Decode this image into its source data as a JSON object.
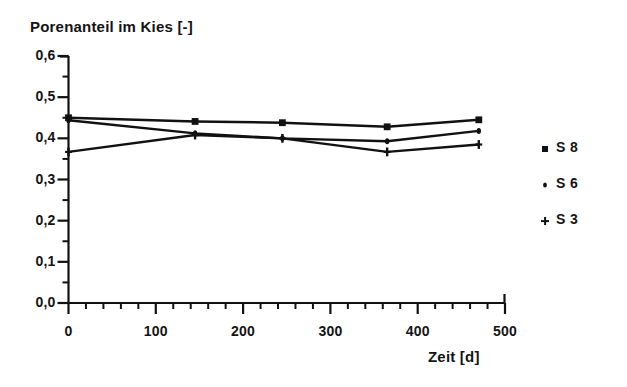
{
  "chart_data": {
    "type": "line",
    "title": "Porenanteil im Kies [-]",
    "xlabel": "Zeit [d]",
    "ylabel": "Porenanteil im Kies [-]",
    "xlim": [
      0,
      500
    ],
    "ylim": [
      0.0,
      0.6
    ],
    "grid": false,
    "legend_position": "right",
    "x_ticks": [
      0,
      100,
      200,
      300,
      400,
      500
    ],
    "x_tick_labels": [
      "0",
      "100",
      "200",
      "300",
      "400",
      "500"
    ],
    "x_minor_tick_step": 20,
    "y_ticks": [
      0.0,
      0.1,
      0.2,
      0.3,
      0.4,
      0.5,
      0.6
    ],
    "y_tick_labels": [
      "0,0",
      "0,1",
      "0,2",
      "0,3",
      "0,4",
      "0,5",
      "0,6"
    ],
    "y_minor_tick_step": 0.05,
    "x": [
      0,
      145,
      245,
      365,
      470
    ],
    "series": [
      {
        "name": "S 8",
        "marker": "square",
        "values": [
          0.45,
          0.441,
          0.438,
          0.428,
          0.445
        ]
      },
      {
        "name": "S 6",
        "marker": "dot",
        "values": [
          0.444,
          0.412,
          0.4,
          0.393,
          0.418
        ]
      },
      {
        "name": "S 3",
        "marker": "plus",
        "values": [
          0.367,
          0.408,
          0.4,
          0.367,
          0.385
        ]
      }
    ]
  },
  "legend": {
    "entries": [
      {
        "label": "S 8",
        "marker": "square-marker"
      },
      {
        "label": "S 6",
        "marker": "dot-marker"
      },
      {
        "label": "S 3",
        "marker": "plus-marker"
      }
    ]
  },
  "axes": {
    "y_tick_labels": [
      "0,6",
      "0,5",
      "0,4",
      "0,3",
      "0,2",
      "0,1",
      "0,0"
    ],
    "x_tick_labels": [
      "0",
      "100",
      "200",
      "300",
      "400",
      "500"
    ]
  },
  "colors": {
    "line": "#111111",
    "text": "#141414",
    "background": "#ffffff"
  }
}
